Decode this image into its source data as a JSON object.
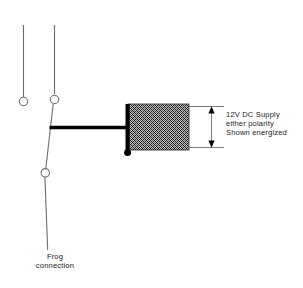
{
  "diagram": {
    "background_color": "#ffffff",
    "stroke_color": "#6b6b6b",
    "heavy_stroke_color": "#000000",
    "text_color": "#1b1b1b",
    "coil_fill_color": "#8a8a8a"
  },
  "annotations": {
    "supply": {
      "line1": "12V DC Supply",
      "line2": "either polarity",
      "line3": "Shown energized"
    },
    "frog": {
      "line1": "Frog",
      "line2": "connection"
    }
  },
  "components": {
    "stock_rail_left": "stock-rail-left",
    "stock_rail_right": "stock-rail-right",
    "terminal_left": "terminal-left",
    "terminal_top": "terminal-top",
    "terminal_bottom": "terminal-bottom",
    "switch_blade": "switch-blade",
    "feed_wire": "feed-wire",
    "coil_block": "coil-block",
    "coil_bar": "coil-bar",
    "coil_terminal_dot": "coil-terminal-dot",
    "dimension_arrow": "dimension-arrow",
    "leader_top": "leader-line-top",
    "leader_bottom": "leader-line-bottom",
    "frog_lead": "frog-lead-wire",
    "frog_tick": "frog-label-tick"
  }
}
